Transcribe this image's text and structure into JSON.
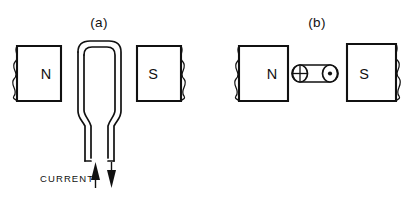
{
  "figure": {
    "title_a": "(a)",
    "title_b": "(b)",
    "background_color": "#ffffff",
    "ink_color": "#111111"
  },
  "panel_a": {
    "label": "(a)",
    "north_pole": {
      "letter": "N",
      "icon": "torn-edge-icon"
    },
    "south_pole": {
      "letter": "S",
      "icon": "torn-edge-icon"
    },
    "conductor": {
      "name": "hairpin-wire-loop",
      "icon": "wire-loop-icon"
    },
    "current": {
      "label": "CURRENT",
      "in_arrow_icon": "arrow-up-icon",
      "out_arrow_icon": "arrow-down-icon"
    }
  },
  "panel_b": {
    "label": "(b)",
    "north_pole": {
      "letter": "N",
      "icon": "torn-edge-icon"
    },
    "south_pole": {
      "letter": "S",
      "icon": "torn-edge-icon"
    },
    "conductor": {
      "name": "straight-rod",
      "icon": "cylinder-icon",
      "left_end_symbol": "current-into-page-icon",
      "left_end_glyph": "⊕",
      "right_end_symbol": "current-out-of-page-icon",
      "right_end_glyph": "⊙"
    }
  }
}
